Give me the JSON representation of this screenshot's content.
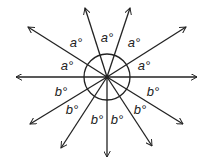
{
  "diagram": {
    "center": [
      107,
      77
    ],
    "circle_radius": 23,
    "stroke_color": "#222222",
    "rays": [
      {
        "id": "right",
        "end": [
          197,
          77
        ]
      },
      {
        "id": "up-right-shallow",
        "end": [
          186,
          27
        ]
      },
      {
        "id": "up-right-steep",
        "end": [
          130,
          8
        ]
      },
      {
        "id": "up-left-steep",
        "end": [
          85,
          8
        ]
      },
      {
        "id": "up-left-shallow",
        "end": [
          28,
          27
        ]
      },
      {
        "id": "left",
        "end": [
          16,
          77
        ]
      },
      {
        "id": "down-left-shallow",
        "end": [
          30,
          124
        ]
      },
      {
        "id": "down-left-steep",
        "end": [
          61,
          148
        ]
      },
      {
        "id": "down",
        "end": [
          107,
          157
        ]
      },
      {
        "id": "down-right-steep",
        "end": [
          152,
          146
        ]
      },
      {
        "id": "down-right-shallow",
        "end": [
          183,
          124
        ]
      }
    ],
    "labels": [
      {
        "text": "a°",
        "pos": [
          144,
          70
        ]
      },
      {
        "text": "a°",
        "pos": [
          134,
          47
        ]
      },
      {
        "text": "a°",
        "pos": [
          107,
          42
        ]
      },
      {
        "text": "a°",
        "pos": [
          76,
          47
        ]
      },
      {
        "text": "a°",
        "pos": [
          67,
          70
        ]
      },
      {
        "text": "b°",
        "pos": [
          61,
          96
        ]
      },
      {
        "text": "b°",
        "pos": [
          72,
          114
        ]
      },
      {
        "text": "b°",
        "pos": [
          97,
          124
        ]
      },
      {
        "text": "b°",
        "pos": [
          117,
          124
        ]
      },
      {
        "text": "b°",
        "pos": [
          140,
          114
        ]
      },
      {
        "text": "b°",
        "pos": [
          153,
          96
        ]
      }
    ]
  }
}
